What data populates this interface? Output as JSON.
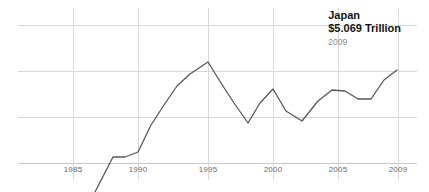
{
  "annotation": {
    "country": "Japan",
    "value": "$5.069 Trillion",
    "year": "2009"
  },
  "axis": {
    "tick_labels": [
      "1985",
      "1990",
      "1995",
      "2000",
      "2005",
      "2009"
    ]
  },
  "colors": {
    "line": "#585858",
    "grid": "#d8d8d8",
    "tick_text": "#6a6a6a",
    "annotation_text": "#141414",
    "annotation_year_text": "#8d8d8d",
    "background": "#ffffff"
  },
  "chart_data": {
    "type": "line",
    "title": "Japan",
    "subtitle": "$5.069 Trillion",
    "annotation_year": "2009",
    "xlabel": "",
    "ylabel": "",
    "grid": true,
    "legend": "none",
    "xlim": [
      1984,
      2009
    ],
    "ylim": [
      0,
      6.0
    ],
    "x_ticks": [
      1985,
      1990,
      1995,
      2000,
      2005,
      2009
    ],
    "x_tick_labels": [
      "1985",
      "1990",
      "1995",
      "2000",
      "2005",
      "2009"
    ],
    "y_gridline_values": [
      1.5,
      3.0,
      4.5
    ],
    "series": [
      {
        "name": "Japan GDP (Trillion USD)",
        "x": [
          1987,
          1988,
          1989,
          1990,
          1991,
          1992,
          1993,
          1994,
          1995,
          1996,
          1997,
          1998,
          1999,
          2000,
          2001,
          2002,
          2003,
          2004,
          2005,
          2006,
          2007,
          2008,
          2009
        ],
        "values": [
          0.05,
          0.45,
          0.45,
          0.52,
          1.16,
          1.79,
          2.62,
          3.48,
          4.36,
          3.56,
          2.91,
          2.31,
          2.99,
          3.49,
          2.77,
          2.45,
          3.03,
          3.45,
          3.44,
          3.14,
          3.13,
          4.11,
          4.25
        ],
        "pixel_points": [
          [
            95,
            192
          ],
          [
            113,
            157
          ],
          [
            125,
            157
          ],
          [
            138,
            152
          ],
          [
            151,
            125
          ],
          [
            164,
            105
          ],
          [
            177,
            86
          ],
          [
            190,
            74
          ],
          [
            208,
            62
          ],
          [
            221,
            83
          ],
          [
            234,
            103
          ],
          [
            248,
            123
          ],
          [
            260,
            103
          ],
          [
            273,
            89
          ],
          [
            286,
            111
          ],
          [
            302,
            121
          ],
          [
            318,
            101
          ],
          [
            332,
            90
          ],
          [
            345,
            91
          ],
          [
            358,
            99
          ],
          [
            371,
            99
          ],
          [
            384,
            80
          ],
          [
            397,
            70
          ]
        ]
      }
    ]
  },
  "geometry": {
    "tick_positions_px": [
      73,
      138,
      208,
      273,
      338,
      398
    ],
    "hgrid_y_px": [
      25,
      71,
      117
    ],
    "baseline_y_px": 163,
    "plot_left_px": 18,
    "plot_right_px": 417
  }
}
